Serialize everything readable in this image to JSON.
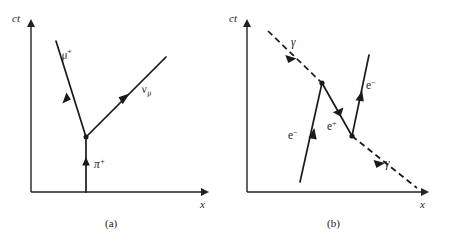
{
  "figure": {
    "background_color": "#ffffff",
    "ink_color": "#1a1a1a",
    "width": 450,
    "height": 242
  },
  "panels": [
    {
      "id": "panel-a",
      "caption": "(a)",
      "axes": {
        "y_label": "ct",
        "x_label": "x",
        "origin": [
          31,
          192
        ],
        "x_end": [
          206,
          192
        ],
        "y_end": [
          31,
          22
        ]
      },
      "vertex": {
        "x": 86,
        "y": 137,
        "label": "decay-vertex"
      },
      "lines": [
        {
          "name": "pion-worldline",
          "particle": "π",
          "charge": "+",
          "label": "π⁺",
          "style": "solid",
          "from": [
            86,
            192
          ],
          "to": [
            86,
            137
          ],
          "arrow_at": [
            86,
            163
          ],
          "label_pos": [
            95,
            166
          ]
        },
        {
          "name": "muon-worldline",
          "particle": "μ",
          "charge": "+",
          "label": "μ⁺",
          "style": "solid",
          "from": [
            86,
            137
          ],
          "to": [
            56,
            41
          ],
          "arrow_at": [
            69,
            99
          ],
          "label_pos": [
            64,
            56
          ]
        },
        {
          "name": "neutrino-worldline",
          "particle": "ν",
          "subscript": "μ",
          "label": "νμ",
          "style": "solid",
          "from": [
            86,
            137
          ],
          "to": [
            166,
            57
          ],
          "arrow_at": [
            124,
            99
          ],
          "label_pos": [
            142,
            95
          ]
        }
      ]
    },
    {
      "id": "panel-b",
      "caption": "(b)",
      "axes": {
        "y_label": "ct",
        "x_label": "x",
        "origin": [
          247,
          192
        ],
        "x_end": [
          426,
          192
        ],
        "y_end": [
          247,
          22
        ]
      },
      "vertices": [
        {
          "x": 322,
          "y": 83,
          "label": "pair-production-vertex"
        },
        {
          "x": 352,
          "y": 136,
          "label": "pair-annihilation-vertex"
        }
      ],
      "lines": [
        {
          "name": "incoming-photon",
          "particle": "γ",
          "label": "γ",
          "style": "dashed",
          "from": [
            268,
            31
          ],
          "to": [
            322,
            83
          ],
          "arrow_at": [
            291,
            53
          ],
          "label_pos": [
            293,
            44
          ]
        },
        {
          "name": "outgoing-photon",
          "particle": "γ",
          "label": "γ",
          "style": "dashed",
          "from": [
            352,
            136
          ],
          "to": [
            417,
            188
          ],
          "arrow_at": [
            380,
            158
          ],
          "label_pos": [
            387,
            164
          ]
        },
        {
          "name": "positron-worldline",
          "particle": "e",
          "charge": "+",
          "label": "e⁺",
          "style": "solid",
          "from": [
            352,
            136
          ],
          "to": [
            322,
            83
          ],
          "arrow_at": [
            339,
            113
          ],
          "label_pos": [
            330,
            128
          ]
        },
        {
          "name": "electron-left-worldline",
          "particle": "e",
          "charge": "−",
          "label": "e⁻",
          "style": "solid",
          "from": [
            300,
            182
          ],
          "to": [
            322,
            83
          ],
          "arrow_at": [
            312,
            136
          ],
          "label_pos": [
            291,
            137
          ]
        },
        {
          "name": "electron-right-worldline",
          "particle": "e",
          "charge": "−",
          "label": "e⁻",
          "style": "solid",
          "from": [
            352,
            136
          ],
          "to": [
            369,
            55
          ],
          "arrow_at": [
            360,
            97
          ],
          "label_pos": [
            369,
            87
          ]
        }
      ]
    }
  ],
  "labels": {
    "ct": "ct",
    "x": "x",
    "pi": "π",
    "mu": "μ",
    "nu": "ν",
    "gamma": "γ",
    "e": "e",
    "plus": "+",
    "minus": "−",
    "mu_sub": "μ",
    "caption_a": "(a)",
    "caption_b": "(b)"
  }
}
